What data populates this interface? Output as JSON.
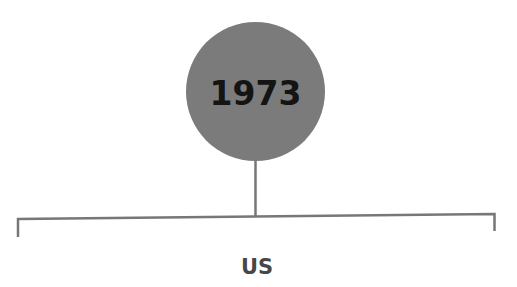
{
  "diagram": {
    "type": "tree",
    "root": {
      "label": "1973",
      "fill_color": "#7b7b7b",
      "text_color": "#141414"
    },
    "children": [
      {
        "label": "US",
        "text_color": "#474747"
      }
    ],
    "line_color": "#777777"
  }
}
